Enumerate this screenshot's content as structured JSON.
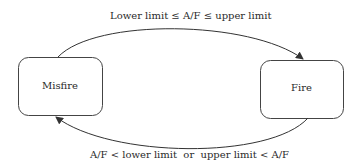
{
  "diagram": {
    "type": "state-transition",
    "states": [
      {
        "id": "misfire",
        "label": "Misfire"
      },
      {
        "id": "fire",
        "label": "Fire"
      }
    ],
    "transitions": [
      {
        "from": "misfire",
        "to": "fire",
        "label": "Lower limit ≤ A/F ≤ upper limit"
      },
      {
        "from": "fire",
        "to": "misfire",
        "label": "A/F < lower limit  or  upper limit < A/F"
      }
    ],
    "colors": {
      "stroke": "#333333",
      "background": "#ffffff"
    }
  }
}
